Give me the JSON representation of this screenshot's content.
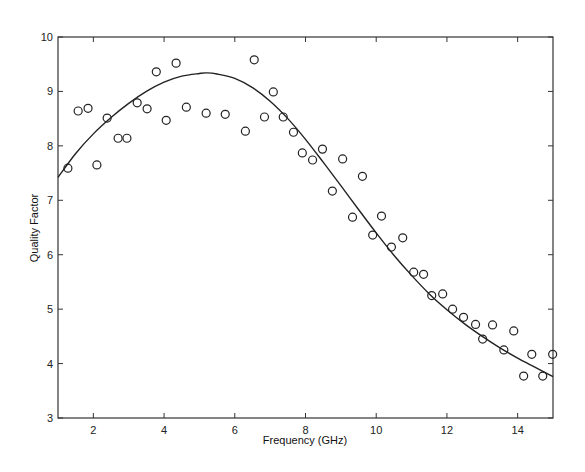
{
  "chart_data": {
    "type": "scatter",
    "title": "",
    "xlabel": "Frequency (GHz)",
    "ylabel": "Quality Factor",
    "xlim": [
      1,
      15
    ],
    "ylim": [
      3,
      10
    ],
    "xticks": [
      2,
      4,
      6,
      8,
      10,
      12,
      14
    ],
    "yticks": [
      3,
      4,
      5,
      6,
      7,
      8,
      9,
      10
    ],
    "grid": false,
    "legend": null,
    "series": [
      {
        "name": "measured",
        "style": "open-circle markers",
        "x": [
          1.28,
          1.57,
          1.85,
          2.1,
          2.39,
          2.7,
          2.95,
          3.24,
          3.52,
          3.78,
          4.06,
          4.34,
          4.63,
          5.19,
          5.73,
          6.3,
          6.55,
          6.84,
          7.09,
          7.37,
          7.66,
          7.91,
          8.2,
          8.48,
          8.76,
          9.05,
          9.33,
          9.61,
          9.9,
          10.15,
          10.43,
          10.75,
          11.06,
          11.34,
          11.57,
          11.88,
          12.16,
          12.47,
          12.81,
          13.01,
          13.29,
          13.61,
          13.89,
          14.17,
          14.4,
          14.71,
          14.99
        ],
        "y": [
          7.59,
          8.64,
          8.69,
          7.65,
          8.51,
          8.14,
          8.14,
          8.79,
          8.68,
          9.36,
          8.47,
          9.52,
          8.71,
          8.6,
          8.58,
          8.27,
          9.58,
          8.53,
          8.99,
          8.53,
          8.25,
          7.87,
          7.74,
          7.94,
          7.17,
          7.76,
          6.69,
          7.44,
          6.36,
          6.71,
          6.14,
          6.31,
          5.68,
          5.64,
          5.25,
          5.28,
          5.0,
          4.85,
          4.72,
          4.45,
          4.71,
          4.25,
          4.6,
          3.77,
          4.17,
          3.77,
          4.17
        ]
      },
      {
        "name": "fit",
        "style": "solid line",
        "x": [
          1.0,
          1.5,
          2.0,
          2.5,
          3.0,
          3.5,
          4.0,
          4.5,
          5.0,
          5.2,
          5.5,
          6.0,
          6.5,
          7.0,
          7.5,
          8.0,
          8.5,
          9.0,
          9.5,
          10.0,
          10.5,
          11.0,
          11.5,
          12.0,
          12.5,
          13.0,
          13.5,
          14.0,
          14.5,
          15.0
        ],
        "y": [
          7.42,
          7.86,
          8.22,
          8.52,
          8.78,
          9.0,
          9.17,
          9.28,
          9.33,
          9.34,
          9.32,
          9.24,
          9.07,
          8.82,
          8.5,
          8.12,
          7.7,
          7.27,
          6.83,
          6.4,
          5.99,
          5.62,
          5.28,
          4.99,
          4.73,
          4.5,
          4.29,
          4.1,
          3.93,
          3.76
        ]
      }
    ]
  }
}
